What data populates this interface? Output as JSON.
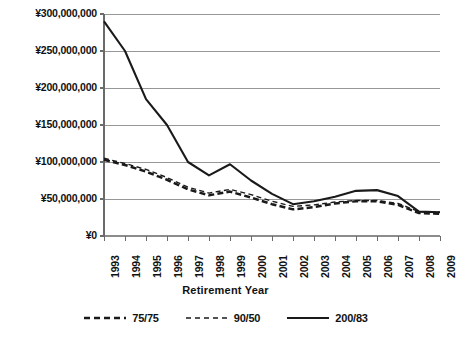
{
  "chart_data": {
    "type": "line",
    "title": "",
    "xlabel": "Retirement Year",
    "ylabel": "",
    "categories": [
      1993,
      1994,
      1995,
      1996,
      1997,
      1998,
      1999,
      2000,
      2001,
      2002,
      2003,
      2004,
      2005,
      2006,
      2007,
      2008,
      2009
    ],
    "x_tick_labels": [
      "1993",
      "1994",
      "1995",
      "1996",
      "1997",
      "1998",
      "1999",
      "2000",
      "2001",
      "2002",
      "2003",
      "2004",
      "2005",
      "2006",
      "2007",
      "2008",
      "2009"
    ],
    "y_tick_labels": [
      "¥0",
      "¥50,000,000",
      "¥100,000,000",
      "¥150,000,000",
      "¥200,000,000",
      "¥250,000,000",
      "¥300,000,000"
    ],
    "y_tick_values": [
      0,
      50000000,
      100000000,
      150000000,
      200000000,
      250000000,
      300000000
    ],
    "ylim": [
      0,
      300000000
    ],
    "grid": "horizontal",
    "legend_position": "bottom",
    "currency_symbol": "¥",
    "series": [
      {
        "name": "75/75",
        "style": "dashed-bold",
        "color": "#1a1a1a",
        "values": [
          103000000,
          96000000,
          87000000,
          76000000,
          63000000,
          55000000,
          60000000,
          52000000,
          43000000,
          36000000,
          39000000,
          44000000,
          47000000,
          47000000,
          42000000,
          31000000,
          30000000
        ]
      },
      {
        "name": "90/50",
        "style": "dashed-thin",
        "color": "#1a1a1a",
        "values": [
          105000000,
          98000000,
          90000000,
          79000000,
          66000000,
          58000000,
          63000000,
          56000000,
          47000000,
          40000000,
          42000000,
          46000000,
          48000000,
          48000000,
          44000000,
          33000000,
          32000000
        ]
      },
      {
        "name": "200/83",
        "style": "solid",
        "color": "#1a1a1a",
        "values": [
          290000000,
          250000000,
          185000000,
          150000000,
          100000000,
          82000000,
          97000000,
          75000000,
          57000000,
          43000000,
          47000000,
          53000000,
          61000000,
          62000000,
          54000000,
          33000000,
          32000000
        ]
      }
    ]
  },
  "legend": {
    "items": [
      {
        "label": "75/75"
      },
      {
        "label": "90/50"
      },
      {
        "label": "200/83"
      }
    ]
  },
  "axis": {
    "x_title": "Retirement Year"
  }
}
